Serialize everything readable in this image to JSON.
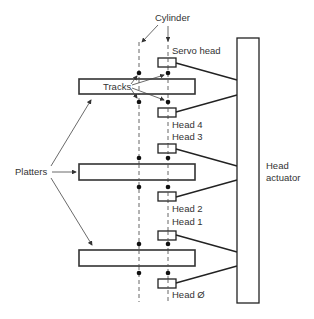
{
  "diagram": {
    "type": "hard-disk-platter-head-assembly",
    "labels": {
      "cylinder": "Cylinder",
      "servo_head": "Servo head",
      "tracks": "Tracks",
      "platters": "Platters",
      "head_4": "Head 4",
      "head_3": "Head 3",
      "head_2": "Head 2",
      "head_1": "Head 1",
      "head_0": "Head Ø",
      "head_actuator_line1": "Head",
      "head_actuator_line2": "actuator"
    },
    "platters": [
      {
        "name": "platter-1",
        "top_head": "Servo head",
        "bottom_head": "Head 4"
      },
      {
        "name": "platter-2",
        "top_head": "Head 3",
        "bottom_head": "Head 2"
      },
      {
        "name": "platter-3",
        "top_head": "Head 1",
        "bottom_head": "Head Ø"
      }
    ],
    "colors": {
      "stroke": "#222222",
      "text": "#333333",
      "background": "#ffffff"
    }
  }
}
